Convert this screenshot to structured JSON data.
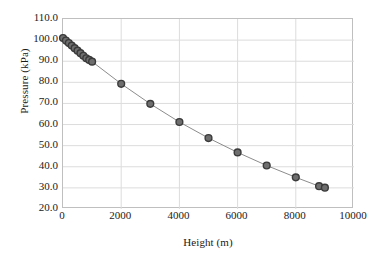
{
  "chart_data": {
    "type": "scatter",
    "title": "",
    "xlabel": "Height (m)",
    "ylabel": "Pressure (kPa)",
    "xlim": [
      0,
      10000
    ],
    "ylim": [
      20.0,
      110.0
    ],
    "xticks": [
      "0",
      "2000",
      "4000",
      "6000",
      "8000",
      "10000"
    ],
    "xtick_values": [
      0,
      2000,
      4000,
      6000,
      8000,
      10000
    ],
    "yticks": [
      "20.0",
      "30.0",
      "40.0",
      "50.0",
      "60.0",
      "70.0",
      "80.0",
      "90.0",
      "100.0",
      "110.0"
    ],
    "ytick_values": [
      20.0,
      30.0,
      40.0,
      50.0,
      60.0,
      70.0,
      80.0,
      90.0,
      100.0,
      110.0
    ],
    "grid": true,
    "grid_axis": "both",
    "legend": false,
    "marker": "circle",
    "marker_color": "#6e6e6e",
    "marker_edge_color": "#3a3a3a",
    "line_color": "#8c8c8c",
    "grid_color": "#dcdcdc",
    "frame_color": "#bfbfbf",
    "series": [
      {
        "name": "Pressure vs Height",
        "x": [
          0,
          100,
          200,
          300,
          400,
          500,
          600,
          700,
          800,
          900,
          1000,
          2000,
          3000,
          4000,
          5000,
          6000,
          7000,
          8000,
          8800,
          9000
        ],
        "y": [
          101.0,
          99.8,
          98.6,
          97.4,
          96.2,
          95.0,
          93.8,
          92.6,
          91.4,
          90.6,
          89.8,
          79.3,
          69.8,
          61.2,
          53.6,
          46.8,
          40.6,
          35.0,
          30.8,
          30.1
        ]
      }
    ]
  }
}
